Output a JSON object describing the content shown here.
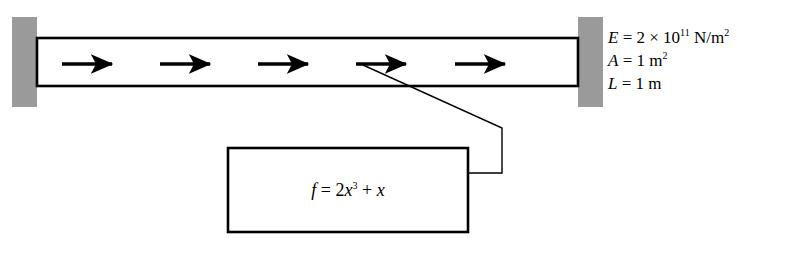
{
  "figure": {
    "type": "engineering-diagram",
    "background_color": "#ffffff"
  },
  "bar": {
    "outline_color": "#000000",
    "fill_color": "#ffffff",
    "left": 37,
    "top": 38,
    "right": 578,
    "bottom": 86
  },
  "supports": {
    "fill_color": "#9a9a9a",
    "left": {
      "x": 12,
      "y": 17,
      "width": 25,
      "height": 90
    },
    "right": {
      "x": 578,
      "y": 17,
      "width": 25,
      "height": 90
    }
  },
  "load_arrows": {
    "direction": "right",
    "count": 5,
    "color": "#000000",
    "y": 64,
    "x_starts": [
      62,
      160,
      258,
      356,
      455
    ],
    "length": 56
  },
  "leader_line": {
    "color": "#000000",
    "points": "363,65 502,128 502,173 468,173"
  },
  "properties": {
    "youngs_modulus": {
      "symbol": "E",
      "equals": "=",
      "coefficient": "2",
      "times": "×",
      "base": "10",
      "exponent": "11",
      "unit": "N/m",
      "unit_exponent": "2"
    },
    "area": {
      "symbol": "A",
      "equals": "=",
      "value": "1",
      "unit": "m",
      "unit_exponent": "2"
    },
    "length": {
      "symbol": "L",
      "equals": "=",
      "value": "1",
      "unit": "m"
    }
  },
  "callout": {
    "box": {
      "x": 228,
      "y": 148,
      "width": 240,
      "height": 84
    },
    "border_color": "#000000",
    "formula": {
      "lhs": "f",
      "equals": "=",
      "term1_coefficient": "2",
      "term1_variable": "x",
      "term1_exponent": "3",
      "plus": "+",
      "term2_variable": "x",
      "full_text": "f = 2x³ + x"
    }
  }
}
